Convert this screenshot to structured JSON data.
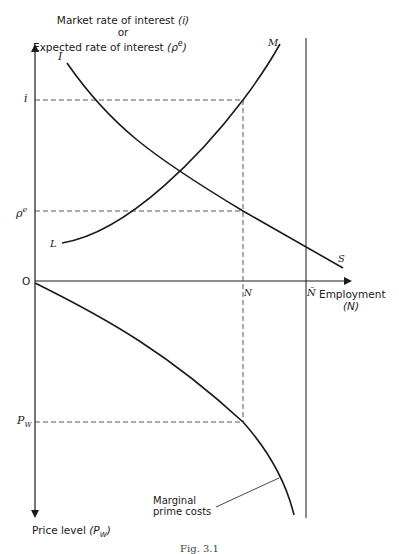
{
  "y_axis_title": {
    "line1": "Market rate of interest ",
    "line1_sym": "(i)",
    "line2": "or",
    "line3": "Expected rate of interest ",
    "line3_sym": "(ρ",
    "line3_sup": "e",
    "line3_close": ")"
  },
  "x_axis_title": {
    "line1": "Employment",
    "line2": "(N)"
  },
  "lower_axis_title": {
    "text": "Price level ",
    "sym": "(P",
    "sub": "W",
    "close": ")"
  },
  "origin_label": "O",
  "tick_labels": {
    "i": "i",
    "rho": "ρ",
    "rho_sup": "e",
    "pw": "P",
    "pw_sub": "W",
    "n": "N",
    "nbar": "N̄"
  },
  "curve_labels": {
    "is_start": "I",
    "is_end": "S",
    "lm_start": "L",
    "lm_end": "M"
  },
  "annotation": {
    "line1": "Marginal",
    "line2": "prime costs"
  },
  "caption": "Fig. 3.1",
  "colors": {
    "ink": "#1a1a1a",
    "background": "#ffffff"
  }
}
